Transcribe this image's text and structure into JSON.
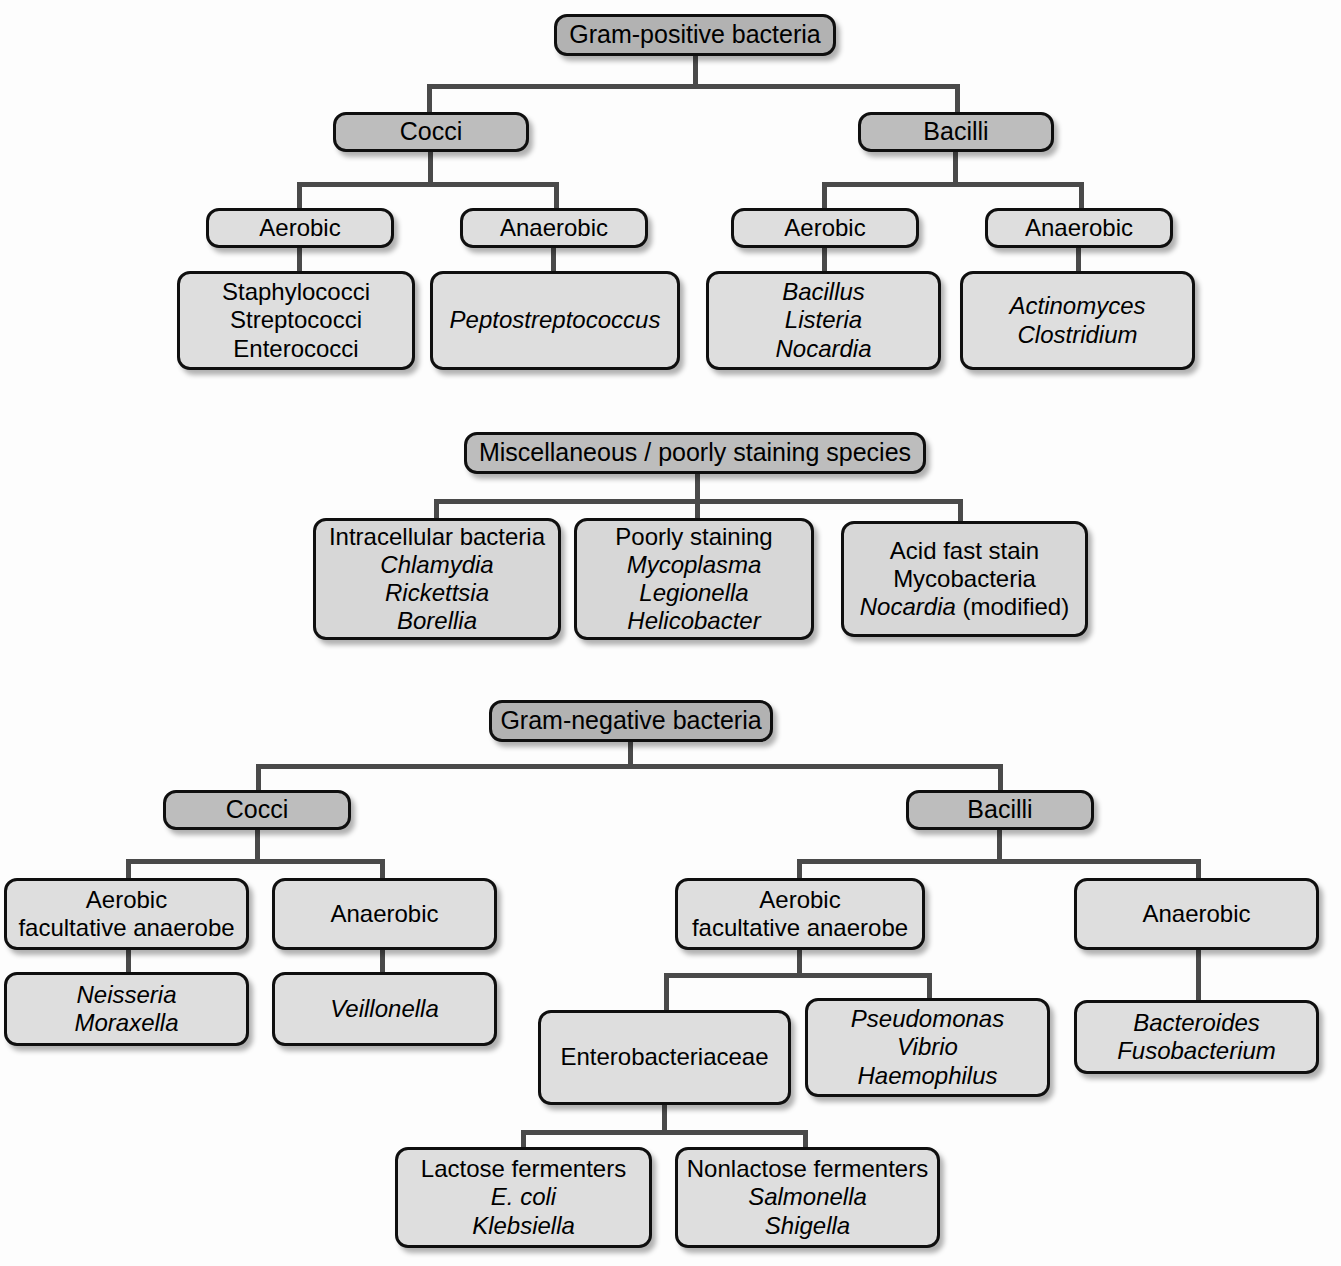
{
  "diagram": {
    "colors": {
      "root_fill": "#b2b2b2",
      "category_fill": "#bdbdbd",
      "leaf_fill": "#dedede",
      "border": "#0f0f0f",
      "connector": "#4a4a4a",
      "background": "#fdfdfd",
      "text": "#000000"
    }
  },
  "gram_positive": {
    "root": "Gram-positive bacteria",
    "cocci": {
      "label": "Cocci",
      "aerobic": {
        "label": "Aerobic",
        "organisms": [
          "Staphylococci",
          "Streptococci",
          "Enterococci"
        ]
      },
      "anaerobic": {
        "label": "Anaerobic",
        "organisms": [
          "Peptostreptococcus"
        ]
      }
    },
    "bacilli": {
      "label": "Bacilli",
      "aerobic": {
        "label": "Aerobic",
        "organisms": [
          "Bacillus",
          "Listeria",
          "Nocardia"
        ]
      },
      "anaerobic": {
        "label": "Anaerobic",
        "organisms": [
          "Actinomyces",
          "Clostridium"
        ]
      }
    }
  },
  "miscellaneous": {
    "root": "Miscellaneous / poorly staining species",
    "groups": [
      {
        "heading": "Intracellular bacteria",
        "organisms": [
          "Chlamydia",
          "Rickettsia",
          "Borellia"
        ]
      },
      {
        "heading": "Poorly staining",
        "organisms": [
          "Mycoplasma",
          "Legionella",
          "Helicobacter"
        ]
      },
      {
        "heading": "Acid fast stain",
        "organisms": [
          "Mycobacteria"
        ],
        "organisms_upright": [
          "Mycobacteria"
        ],
        "last_line_italic": "Nocardia",
        "last_line_upright": " (modified)"
      }
    ]
  },
  "gram_negative": {
    "root": "Gram-negative bacteria",
    "cocci": {
      "label": "Cocci",
      "aerobic": {
        "label_line1": "Aerobic",
        "label_line2": "facultative anaerobe",
        "organisms": [
          "Neisseria",
          "Moraxella"
        ]
      },
      "anaerobic": {
        "label": "Anaerobic",
        "organisms": [
          "Veillonella"
        ]
      }
    },
    "bacilli": {
      "label": "Bacilli",
      "aerobic": {
        "label_line1": "Aerobic",
        "label_line2": "facultative anaerobe",
        "family": {
          "label": "Enterobacteriaceae",
          "lactose": {
            "heading": "Lactose fermenters",
            "organisms": [
              "E. coli",
              "Klebsiella"
            ]
          },
          "nonlactose": {
            "heading": "Nonlactose fermenters",
            "organisms": [
              "Salmonella",
              "Shigella"
            ]
          }
        },
        "other_organisms": [
          "Pseudomonas",
          "Vibrio",
          "Haemophilus"
        ]
      },
      "anaerobic": {
        "label": "Anaerobic",
        "organisms": [
          "Bacteroides",
          "Fusobacterium"
        ]
      }
    }
  }
}
